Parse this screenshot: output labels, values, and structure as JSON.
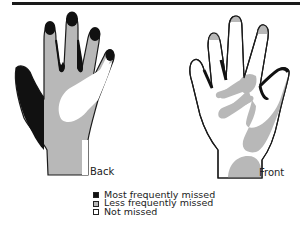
{
  "figure": {
    "back_label": "Back",
    "front_label": "Front"
  },
  "legend": {
    "items": [
      {
        "label": "Most frequently missed",
        "color": "#111111"
      },
      {
        "label": "Less frequently missed",
        "color": "#b8b8b8"
      },
      {
        "label": "Not missed",
        "color": "#ffffff"
      }
    ]
  },
  "colors": {
    "most": "#111111",
    "less": "#b8b8b8",
    "not": "#ffffff",
    "outline": "#1a1a1a"
  }
}
